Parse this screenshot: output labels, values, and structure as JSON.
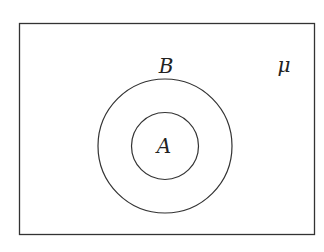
{
  "diagram": {
    "type": "venn",
    "universe": {
      "label": "μ"
    },
    "sets": [
      {
        "label": "B",
        "role": "outer"
      },
      {
        "label": "A",
        "role": "inner",
        "subset_of": "B"
      }
    ],
    "colors": {
      "stroke": "#333333",
      "background": "#ffffff"
    }
  }
}
